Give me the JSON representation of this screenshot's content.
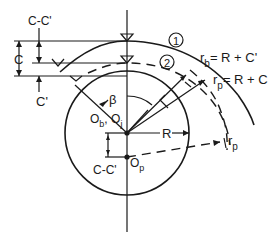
{
  "figure": {
    "type": "bearing-clearance-geometry",
    "labels": {
      "c_minus_cprime_top": "C-C'",
      "c": "C",
      "c_prime": "C'",
      "arc1": "1",
      "arc2": "2",
      "rb_eq": "= R + C'",
      "rb_sym": "r",
      "rb_sub": "b",
      "rp_eq": "= R + C",
      "rp_sym": "r",
      "rp_sub": "p",
      "beta": "β",
      "ob": "O",
      "ob_sub": "b",
      "oj": "O",
      "oj_sub": "j",
      "r_label": "R",
      "c_minus_cprime_bottom": "C-C'",
      "op": "O",
      "op_sub": "p",
      "rp_side_sym": "r",
      "rp_side_sub": "p"
    },
    "colors": {
      "ink": "#1a1a1a",
      "background": "#ffffff"
    }
  }
}
